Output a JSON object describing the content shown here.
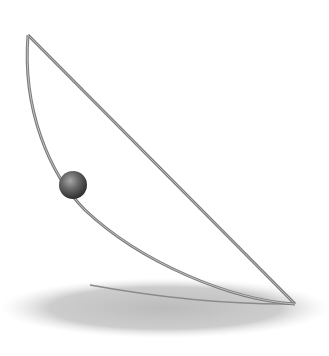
{
  "figure": {
    "colors": {
      "background": "#ffffff",
      "wire": "#7a7a7a",
      "wire_highlight": "#b5b5b5",
      "ball_dark": "#3a3a3a",
      "ball_light": "#9a9a9a",
      "shadow": "#bdbdbd"
    },
    "apex": [
      28,
      35
    ],
    "bottom_vertex": [
      295,
      304
    ],
    "ball": {
      "cx": 73,
      "cy": 185,
      "r": 14
    }
  }
}
